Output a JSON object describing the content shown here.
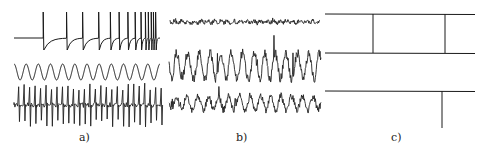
{
  "figure": {
    "panels": [
      {
        "id": "a",
        "label": "a)",
        "traces": [
          {
            "name": "bursting-spike-train",
            "kind": "spike-burst",
            "spike_times": [
              0.2,
              0.36,
              0.47,
              0.58,
              0.66,
              0.72,
              0.78,
              0.83,
              0.87,
              0.9,
              0.92,
              0.94,
              0.955,
              0.97
            ]
          },
          {
            "name": "sinusoid",
            "kind": "sine",
            "cycles": 12
          },
          {
            "name": "regular-spiking",
            "kind": "noisy-spikes",
            "spike_count": 27
          }
        ]
      },
      {
        "id": "b",
        "label": "b)",
        "traces": [
          {
            "name": "low-amplitude-irregular",
            "kind": "noise",
            "amplitude": "low"
          },
          {
            "name": "high-amplitude-irregular",
            "kind": "noise",
            "amplitude": "high"
          },
          {
            "name": "medium-amplitude-irregular",
            "kind": "noise",
            "amplitude": "medium"
          }
        ]
      },
      {
        "id": "c",
        "label": "c)",
        "traces": [
          {
            "name": "line-top",
            "kind": "flat"
          },
          {
            "name": "line-middle",
            "kind": "flat"
          },
          {
            "name": "line-bottom",
            "kind": "flat"
          }
        ],
        "events": [
          {
            "name": "event-1",
            "from": "line-top",
            "to": "line-middle",
            "position": 0.32
          },
          {
            "name": "event-2",
            "from": "line-top",
            "to": "line-middle",
            "position": 0.8
          },
          {
            "name": "event-3",
            "from": "line-bottom",
            "direction": "down",
            "position": 0.78
          }
        ]
      }
    ]
  }
}
